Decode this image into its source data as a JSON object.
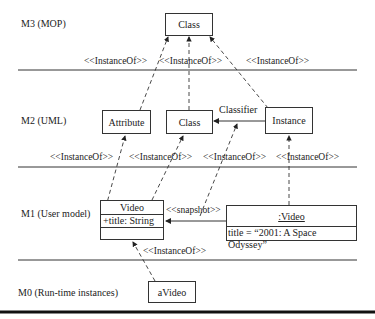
{
  "levels": [
    {
      "id": "M3",
      "label": "M3 (MOP)"
    },
    {
      "id": "M2",
      "label": "M2 (UML)"
    },
    {
      "id": "M1",
      "label": "M1 (User model)"
    },
    {
      "id": "M0",
      "label": "M0 (Run-time instances)"
    }
  ],
  "m3": {
    "class_box": "Class"
  },
  "m2": {
    "attribute_box": "Attribute",
    "class_box": "Class",
    "instance_box": "Instance",
    "classifier_label": "Classifier"
  },
  "m1": {
    "video_class": {
      "name": "Video",
      "attribute": "+title: String"
    },
    "video_instance": {
      "name": ":Video",
      "slot": "title = “2001: A Space Odyssey”"
    },
    "snapshot_label": "<<snapshot>>"
  },
  "m0": {
    "avideo_box": "aVideo"
  },
  "stereotypes": {
    "m3_m2": [
      "<<InstanceOf>>",
      "<<InstanceOf>>",
      "<<InstanceOf>>"
    ],
    "m2_m1": [
      "<<InstanceOf>>",
      "<<InstanceOf>>",
      "<<InstanceOf>>",
      "<<InstanceOf>>"
    ],
    "m1_m0": [
      "<<InstanceOf>>"
    ]
  }
}
